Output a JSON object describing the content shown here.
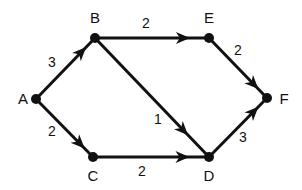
{
  "diagram": {
    "type": "directed-weighted-graph",
    "nodes": [
      {
        "id": "A",
        "label": "A",
        "x": 36,
        "y": 99,
        "lx": 23,
        "ly": 104
      },
      {
        "id": "B",
        "label": "B",
        "x": 95,
        "y": 38,
        "lx": 95,
        "ly": 23
      },
      {
        "id": "E",
        "label": "E",
        "x": 209,
        "y": 38,
        "lx": 209,
        "ly": 23
      },
      {
        "id": "F",
        "label": "F",
        "x": 267,
        "y": 98,
        "lx": 284,
        "ly": 104
      },
      {
        "id": "C",
        "label": "C",
        "x": 93,
        "y": 157,
        "lx": 93,
        "ly": 181
      },
      {
        "id": "D",
        "label": "D",
        "x": 209,
        "y": 157,
        "lx": 209,
        "ly": 181
      }
    ],
    "edges": [
      {
        "from": "A",
        "to": "B",
        "weight": "3",
        "wx": 52,
        "wy": 67
      },
      {
        "from": "A",
        "to": "C",
        "weight": "2",
        "wx": 52,
        "wy": 136
      },
      {
        "from": "B",
        "to": "E",
        "weight": "2",
        "wx": 146,
        "wy": 28
      },
      {
        "from": "B",
        "to": "D",
        "weight": "1",
        "wx": 158,
        "wy": 124
      },
      {
        "from": "C",
        "to": "D",
        "weight": "2",
        "wx": 142,
        "wy": 176
      },
      {
        "from": "E",
        "to": "F",
        "weight": "2",
        "wx": 238,
        "wy": 55
      },
      {
        "from": "D",
        "to": "F",
        "weight": "3",
        "wx": 243,
        "wy": 142
      }
    ],
    "colors": {
      "stroke": "#111111",
      "background": "#ffffff"
    }
  }
}
